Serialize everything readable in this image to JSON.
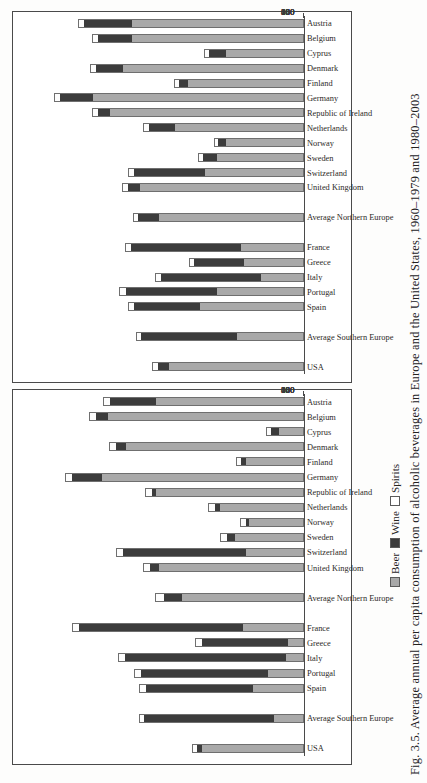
{
  "caption": "Fig. 3.5. Average annual per capita consumption of alcoholic beverages in Europe and the United States, 1960–1979 and 1980–2003",
  "legend": {
    "beer": "Beer",
    "wine": "Wine",
    "spirits": "Spirits"
  },
  "colors": {
    "beer": "#a9a9a9",
    "wine": "#3c3c3c",
    "spirits": "#ffffff",
    "axis": "#4a4a4a",
    "text": "#23211f",
    "page": "#fdfdfc"
  },
  "chart_data": {
    "type": "bar",
    "title": "Average annual per capita consumption of alcoholic beverages in Europe and the United States",
    "orientation": "vertical-stacked",
    "stacked": true,
    "xlabel": "",
    "ylabel": "",
    "ylim": [
      0,
      180
    ],
    "yticks": [
      0,
      20,
      40,
      60,
      80,
      100,
      120,
      140,
      160,
      180
    ],
    "grid": false,
    "legend_position": "bottom",
    "legend_entries": [
      "Beer",
      "Wine",
      "Spirits"
    ],
    "panels": [
      {
        "name": "panel-1960-1979",
        "period": "1960–1979",
        "categories": [
          "USA",
          "",
          "Average Southern Europe",
          "",
          "Spain",
          "Portugal",
          "Italy",
          "Greece",
          "France",
          "",
          "Average Northern Europe",
          "",
          "United Kingdom",
          "Switzerland",
          "Sweden",
          "Norway",
          "Netherlands",
          "Republic of Ireland",
          "Germany",
          "Finland",
          "Denmark",
          "Cyprus",
          "Belgium",
          "Austria"
        ],
        "series": [
          {
            "name": "Beer",
            "values": [
              67,
              null,
              19,
              null,
              33,
              23,
              11,
              10,
              40,
              null,
              80,
              null,
              95,
              38,
              45,
              36,
              55,
              97,
              133,
              38,
              117,
              16,
              129,
              97
            ]
          },
          {
            "name": "Wine",
            "values": [
              3,
              null,
              86,
              null,
              71,
              84,
              107,
              57,
              108,
              null,
              12,
              null,
              6,
              81,
              5,
              2,
              3,
              3,
              20,
              3,
              7,
              5,
              8,
              31
            ]
          },
          {
            "name": "Spirits",
            "values": [
              3,
              null,
              3,
              null,
              4,
              4,
              4,
              4,
              4,
              null,
              5,
              null,
              4,
              4,
              4,
              3,
              4,
              4,
              4,
              3,
              4,
              3,
              4,
              4
            ]
          }
        ],
        "totals": [
          73,
          null,
          108,
          null,
          108,
          111,
          122,
          71,
          152,
          null,
          97,
          null,
          105,
          123,
          54,
          41,
          62,
          104,
          157,
          44,
          128,
          24,
          141,
          132
        ]
      },
      {
        "name": "panel-1980-2003",
        "period": "1980–2003",
        "categories": [
          "USA",
          "",
          "Average Southern Europe",
          "",
          "Spain",
          "Portugal",
          "Italy",
          "Greece",
          "France",
          "",
          "Average Northern Europe",
          "",
          "United Kingdom",
          "Switzerland",
          "Sweden",
          "Norway",
          "Netherlands",
          "Republic of Ireland",
          "Germany",
          "Finland",
          "Denmark",
          "Cyprus",
          "Belgium",
          "Austria"
        ],
        "series": [
          {
            "name": "Beer",
            "values": [
              89,
              null,
              44,
              null,
              68,
              57,
              28,
              39,
              41,
              null,
              95,
              null,
              108,
              65,
              57,
              51,
              85,
              128,
              139,
              76,
              119,
              51,
              113,
              113
            ]
          },
          {
            "name": "Wine",
            "values": [
              7,
              null,
              63,
              null,
              44,
              60,
              66,
              33,
              73,
              null,
              14,
              null,
              8,
              47,
              9,
              5,
              17,
              8,
              22,
              6,
              18,
              11,
              23,
              32
            ]
          },
          {
            "name": "Spirits",
            "values": [
              3,
              null,
              3,
              null,
              3,
              4,
              3,
              3,
              3,
              null,
              3,
              null,
              3,
              3,
              3,
              2,
              3,
              3,
              3,
              3,
              3,
              3,
              3,
              3
            ]
          }
        ],
        "totals": [
          99,
          null,
          110,
          null,
          115,
          121,
          97,
          75,
          117,
          null,
          112,
          null,
          119,
          115,
          69,
          58,
          105,
          139,
          164,
          85,
          140,
          65,
          139,
          148
        ]
      }
    ]
  }
}
